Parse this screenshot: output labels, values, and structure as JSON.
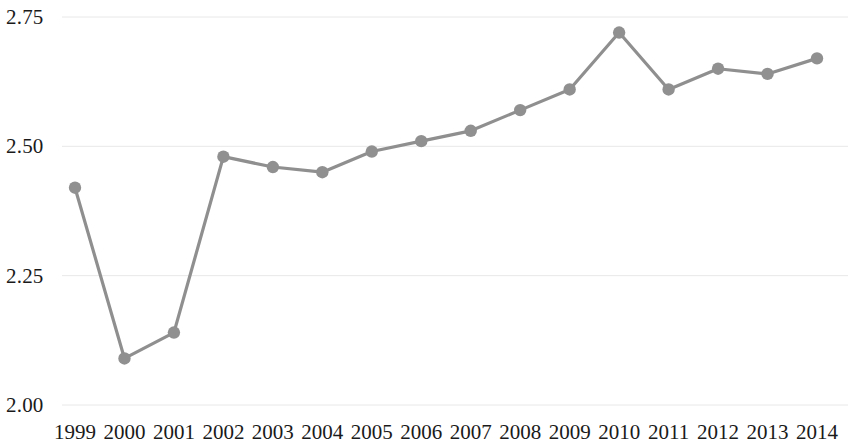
{
  "chart_data": {
    "type": "line",
    "title": "",
    "subtitle": "",
    "xlabel": "",
    "ylabel": "",
    "categories": [
      "1999",
      "2000",
      "2001",
      "2002",
      "2003",
      "2004",
      "2005",
      "2006",
      "2007",
      "2008",
      "2009",
      "2010",
      "2011",
      "2012",
      "2013",
      "2014"
    ],
    "values": [
      2.42,
      2.09,
      2.14,
      2.48,
      2.46,
      2.45,
      2.49,
      2.51,
      2.53,
      2.57,
      2.61,
      2.72,
      2.61,
      2.65,
      2.64,
      2.67
    ],
    "series": [
      {
        "name": "",
        "values": [
          2.42,
          2.09,
          2.14,
          2.48,
          2.46,
          2.45,
          2.49,
          2.51,
          2.53,
          2.57,
          2.61,
          2.72,
          2.61,
          2.65,
          2.64,
          2.67
        ]
      }
    ],
    "ylim": [
      2.0,
      2.75
    ],
    "yticks": [
      2.0,
      2.25,
      2.5,
      2.75
    ],
    "ytick_labels": [
      "2.00",
      "2.25",
      "2.50",
      "2.75"
    ],
    "xtick_labels": [
      "1999",
      "2000",
      "2001",
      "2002",
      "2003",
      "2004",
      "2005",
      "2006",
      "2007",
      "2008",
      "2009",
      "2010",
      "2011",
      "2012",
      "2013",
      "2014"
    ],
    "grid": true,
    "grid_axis": "y",
    "legend": false,
    "legend_position": "none",
    "annotations": [],
    "marker": "circle",
    "line_color": "#8f8f8f",
    "marker_color": "#909090",
    "grid_color": "#e8e8e8",
    "background_color": "#ffffff",
    "text_color": "#1a1a1a"
  }
}
